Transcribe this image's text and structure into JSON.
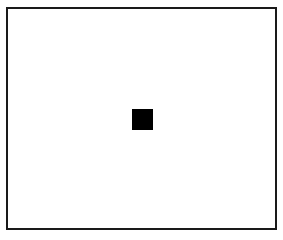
{
  "figure": {
    "frame": {
      "border_color": "#1a1a1a",
      "background": "#ffffff"
    },
    "marker": {
      "shape": "square",
      "color": "#000000"
    }
  }
}
